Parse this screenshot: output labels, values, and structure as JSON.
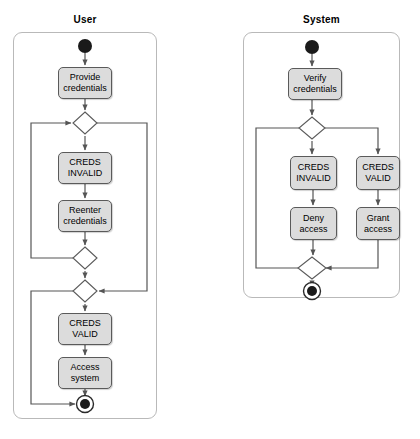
{
  "diagram": {
    "type": "uml-activity-diagram",
    "title_visible": false,
    "colors": {
      "node_fill": "#dcdcdc",
      "node_stroke": "#5a5a5a",
      "lane_stroke": "#b9b9b9",
      "edge_stroke": "#555555",
      "terminal_fill": "#1a1a1a",
      "background": "#ffffff"
    }
  },
  "lanes": [
    {
      "id": "user",
      "title": "User",
      "nodes": [
        {
          "id": "user-start",
          "kind": "initial-node",
          "label": ""
        },
        {
          "id": "user-provide-credentials",
          "kind": "action",
          "label": "Provide\ncredentials"
        },
        {
          "id": "user-merge-1",
          "kind": "merge-node",
          "label": ""
        },
        {
          "id": "user-creds-invalid",
          "kind": "action",
          "label": "CREDS\nINVALID"
        },
        {
          "id": "user-reenter-credentials",
          "kind": "action",
          "label": "Reenter\ncredentials"
        },
        {
          "id": "user-decision-1",
          "kind": "decision-node",
          "label": ""
        },
        {
          "id": "user-merge-2",
          "kind": "merge-node",
          "label": ""
        },
        {
          "id": "user-creds-valid",
          "kind": "action",
          "label": "CREDS\nVALID"
        },
        {
          "id": "user-access-system",
          "kind": "action",
          "label": "Access\nsystem"
        },
        {
          "id": "user-final",
          "kind": "final-node",
          "label": ""
        }
      ]
    },
    {
      "id": "system",
      "title": "System",
      "nodes": [
        {
          "id": "system-start",
          "kind": "initial-node",
          "label": ""
        },
        {
          "id": "system-verify-credentials",
          "kind": "action",
          "label": "Verify\ncredentials"
        },
        {
          "id": "system-decision-1",
          "kind": "decision-node",
          "label": ""
        },
        {
          "id": "system-creds-invalid",
          "kind": "action",
          "label": "CREDS\nINVALID"
        },
        {
          "id": "system-creds-valid",
          "kind": "action",
          "label": "CREDS\nVALID"
        },
        {
          "id": "system-deny-access",
          "kind": "action",
          "label": "Deny\naccess"
        },
        {
          "id": "system-grant-access",
          "kind": "action",
          "label": "Grant\naccess"
        },
        {
          "id": "system-merge-1",
          "kind": "merge-node",
          "label": ""
        },
        {
          "id": "system-final",
          "kind": "final-node",
          "label": ""
        }
      ]
    }
  ],
  "labels": {
    "user_lane_title": "User",
    "system_lane_title": "System",
    "user_provide_credentials": "Provide\ncredentials",
    "user_creds_invalid": "CREDS\nINVALID",
    "user_reenter_credentials": "Reenter\ncredentials",
    "user_creds_valid": "CREDS\nVALID",
    "user_access_system": "Access\nsystem",
    "system_verify_credentials": "Verify\ncredentials",
    "system_creds_invalid": "CREDS\nINVALID",
    "system_creds_valid": "CREDS\nVALID",
    "system_deny_access": "Deny\naccess",
    "system_grant_access": "Grant\naccess"
  }
}
